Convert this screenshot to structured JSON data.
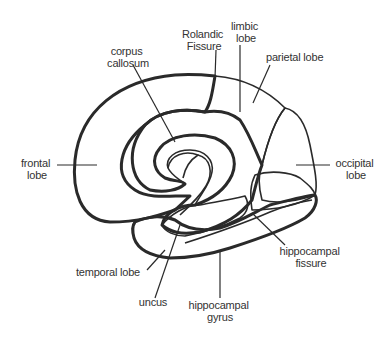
{
  "figure": {
    "background": "#ffffff",
    "ink": "#2a2a2a"
  },
  "legend_patterns": {
    "dots": "cortex lobes (frontal, occipital)",
    "vertical-lines": "parietal / temporal / hippocampal gyrus",
    "crosshatch": "limbic lobe (cingulate / uncus)"
  },
  "labels": {
    "rolandic": [
      "Rolandic",
      "Fissure"
    ],
    "limbic": [
      "limbic",
      "lobe"
    ],
    "parietal": "parietal lobe",
    "corpus": [
      "corpus",
      "callosum"
    ],
    "frontal": [
      "frontal",
      "lobe"
    ],
    "occipital": [
      "occipital",
      "lobe"
    ],
    "hippo_fissure": [
      "hippocampal",
      "fissure"
    ],
    "temporal": "temporal lobe",
    "uncus": "uncus",
    "hippo_gyrus": [
      "hippocampal",
      "gyrus"
    ]
  }
}
